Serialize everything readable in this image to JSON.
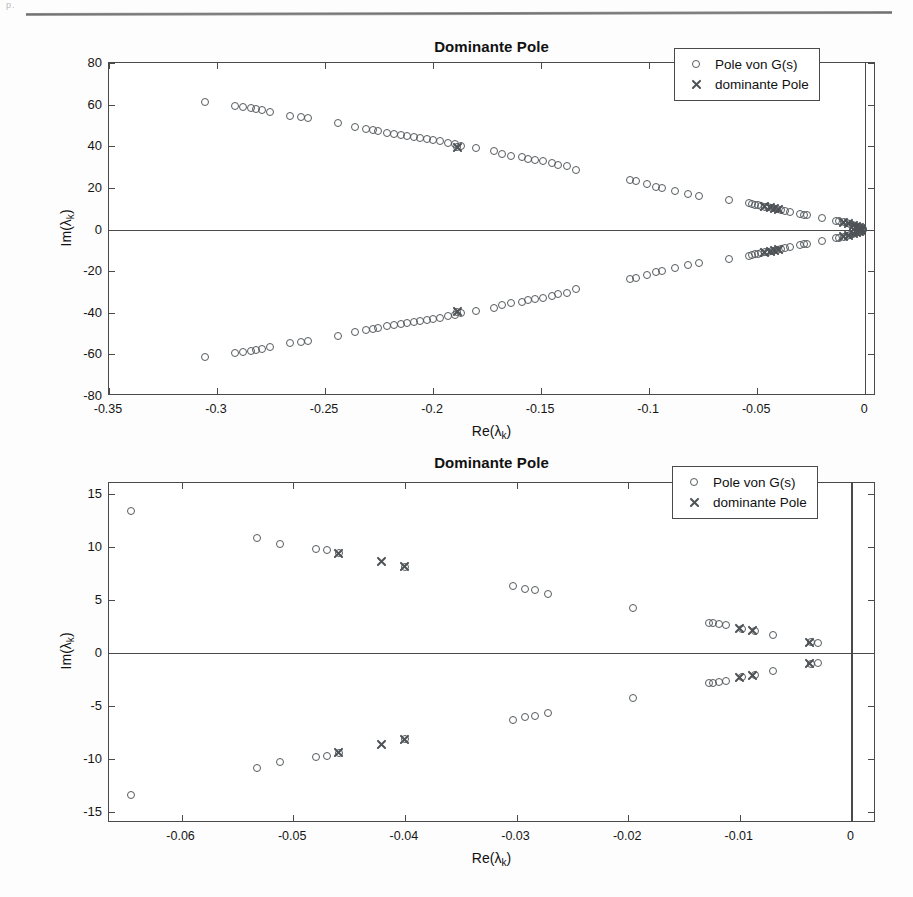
{
  "page": {
    "corner_mark": "p.",
    "background": "#fdfdfd",
    "rule_color": "#7a7a7a"
  },
  "colors": {
    "marker": "#555a5e",
    "axis": "#4a4a4a",
    "text": "#111111"
  },
  "legend": {
    "entries": [
      {
        "marker": "circle",
        "label": "Pole von G(s)"
      },
      {
        "marker": "cross",
        "label": "dominante Pole"
      }
    ]
  },
  "chart_data": [
    {
      "type": "scatter",
      "title": "Dominante Pole",
      "xlabel": "Re(λ_k)",
      "ylabel": "Im(λ_k)",
      "xlim": [
        -0.35,
        0.005
      ],
      "ylim": [
        -80,
        80
      ],
      "xticks": [
        -0.35,
        -0.3,
        -0.25,
        -0.2,
        -0.15,
        -0.1,
        -0.05,
        0
      ],
      "xticklabels": [
        "-0.35",
        "-0.3",
        "-0.25",
        "-0.2",
        "-0.15",
        "-0.1",
        "-0.05",
        "0"
      ],
      "yticks": [
        -80,
        -60,
        -40,
        -20,
        0,
        20,
        40,
        60,
        80
      ],
      "yticklabels": [
        "-80",
        "-60",
        "-40",
        "-20",
        "0",
        "20",
        "40",
        "60",
        "80"
      ],
      "grid": false,
      "legend_position": "upper right",
      "series": [
        {
          "name": "Pole von G(s)",
          "marker": "circle",
          "points": [
            [
              -0.3055,
              61.3
            ],
            [
              -0.2915,
              59.2
            ],
            [
              -0.288,
              58.9
            ],
            [
              -0.2845,
              58.4
            ],
            [
              -0.282,
              57.8
            ],
            [
              -0.279,
              57.3
            ],
            [
              -0.2755,
              56.6
            ],
            [
              -0.266,
              54.6
            ],
            [
              -0.261,
              54.0
            ],
            [
              -0.258,
              53.6
            ],
            [
              -0.244,
              51.0
            ],
            [
              -0.236,
              49.3
            ],
            [
              -0.231,
              48.1
            ],
            [
              -0.228,
              47.6
            ],
            [
              -0.2255,
              47.2
            ],
            [
              -0.2215,
              46.5
            ],
            [
              -0.218,
              45.9
            ],
            [
              -0.215,
              45.4
            ],
            [
              -0.212,
              44.9
            ],
            [
              -0.209,
              44.4
            ],
            [
              -0.206,
              43.9
            ],
            [
              -0.203,
              43.4
            ],
            [
              -0.2,
              42.9
            ],
            [
              -0.197,
              42.4
            ],
            [
              -0.193,
              41.6
            ],
            [
              -0.19,
              41.1
            ],
            [
              -0.187,
              40.3
            ],
            [
              -0.18,
              39.3
            ],
            [
              -0.189,
              39.7
            ],
            [
              -0.172,
              37.6
            ],
            [
              -0.168,
              36.3
            ],
            [
              -0.164,
              35.5
            ],
            [
              -0.159,
              34.6
            ],
            [
              -0.156,
              34.0
            ],
            [
              -0.153,
              33.6
            ],
            [
              -0.149,
              32.8
            ],
            [
              -0.145,
              32.0
            ],
            [
              -0.142,
              31.1
            ],
            [
              -0.138,
              30.3
            ],
            [
              -0.134,
              28.6
            ],
            [
              -0.109,
              23.8
            ],
            [
              -0.106,
              23.2
            ],
            [
              -0.101,
              21.8
            ],
            [
              -0.097,
              20.6
            ],
            [
              -0.094,
              19.7
            ],
            [
              -0.088,
              18.4
            ],
            [
              -0.082,
              16.9
            ],
            [
              -0.077,
              15.9
            ],
            [
              -0.063,
              14.4
            ],
            [
              -0.054,
              12.7
            ],
            [
              -0.0525,
              12.2
            ],
            [
              -0.051,
              11.9
            ],
            [
              -0.0495,
              11.6
            ],
            [
              -0.048,
              11.2
            ],
            [
              -0.0465,
              10.9
            ],
            [
              -0.045,
              10.6
            ],
            [
              -0.043,
              10.2
            ],
            [
              -0.041,
              9.8
            ],
            [
              -0.039,
              9.3
            ],
            [
              -0.037,
              8.9
            ],
            [
              -0.035,
              8.5
            ],
            [
              -0.03,
              7.4
            ],
            [
              -0.0285,
              7.1
            ],
            [
              -0.027,
              6.8
            ],
            [
              -0.02,
              5.6
            ],
            [
              -0.0135,
              4.2
            ],
            [
              -0.012,
              3.9
            ],
            [
              -0.01,
              3.4
            ],
            [
              -0.0085,
              3.0
            ],
            [
              -0.007,
              2.6
            ],
            [
              -0.0055,
              2.1
            ],
            [
              -0.0045,
              1.8
            ],
            [
              -0.0035,
              1.4
            ],
            [
              -0.0025,
              1.0
            ],
            [
              -0.0018,
              0.7
            ],
            [
              -0.001,
              0.4
            ],
            [
              -0.3055,
              -61.3
            ],
            [
              -0.2915,
              -59.2
            ],
            [
              -0.288,
              -58.9
            ],
            [
              -0.2845,
              -58.4
            ],
            [
              -0.282,
              -57.8
            ],
            [
              -0.279,
              -57.3
            ],
            [
              -0.2755,
              -56.6
            ],
            [
              -0.266,
              -54.6
            ],
            [
              -0.261,
              -54.0
            ],
            [
              -0.258,
              -53.6
            ],
            [
              -0.244,
              -51.0
            ],
            [
              -0.236,
              -49.3
            ],
            [
              -0.231,
              -48.1
            ],
            [
              -0.228,
              -47.6
            ],
            [
              -0.2255,
              -47.2
            ],
            [
              -0.2215,
              -46.5
            ],
            [
              -0.218,
              -45.9
            ],
            [
              -0.215,
              -45.4
            ],
            [
              -0.212,
              -44.9
            ],
            [
              -0.209,
              -44.4
            ],
            [
              -0.206,
              -43.9
            ],
            [
              -0.203,
              -43.4
            ],
            [
              -0.2,
              -42.9
            ],
            [
              -0.197,
              -42.4
            ],
            [
              -0.193,
              -41.6
            ],
            [
              -0.19,
              -41.1
            ],
            [
              -0.187,
              -40.3
            ],
            [
              -0.18,
              -39.3
            ],
            [
              -0.189,
              -39.7
            ],
            [
              -0.172,
              -37.6
            ],
            [
              -0.168,
              -36.3
            ],
            [
              -0.164,
              -35.5
            ],
            [
              -0.159,
              -34.6
            ],
            [
              -0.156,
              -34.0
            ],
            [
              -0.153,
              -33.6
            ],
            [
              -0.149,
              -32.8
            ],
            [
              -0.145,
              -32.0
            ],
            [
              -0.142,
              -31.1
            ],
            [
              -0.138,
              -30.3
            ],
            [
              -0.134,
              -28.6
            ],
            [
              -0.109,
              -23.8
            ],
            [
              -0.106,
              -23.2
            ],
            [
              -0.101,
              -21.8
            ],
            [
              -0.097,
              -20.6
            ],
            [
              -0.094,
              -19.7
            ],
            [
              -0.088,
              -18.4
            ],
            [
              -0.082,
              -16.9
            ],
            [
              -0.077,
              -15.9
            ],
            [
              -0.063,
              -14.4
            ],
            [
              -0.054,
              -12.7
            ],
            [
              -0.0525,
              -12.2
            ],
            [
              -0.051,
              -11.9
            ],
            [
              -0.0495,
              -11.6
            ],
            [
              -0.048,
              -11.2
            ],
            [
              -0.0465,
              -10.9
            ],
            [
              -0.045,
              -10.6
            ],
            [
              -0.043,
              -10.2
            ],
            [
              -0.041,
              -9.8
            ],
            [
              -0.039,
              -9.3
            ],
            [
              -0.037,
              -8.9
            ],
            [
              -0.035,
              -8.5
            ],
            [
              -0.03,
              -7.4
            ],
            [
              -0.0285,
              -7.1
            ],
            [
              -0.027,
              -6.8
            ],
            [
              -0.02,
              -5.6
            ],
            [
              -0.0135,
              -4.2
            ],
            [
              -0.012,
              -3.9
            ],
            [
              -0.01,
              -3.4
            ],
            [
              -0.0085,
              -3.0
            ],
            [
              -0.007,
              -2.6
            ],
            [
              -0.0055,
              -2.1
            ],
            [
              -0.0045,
              -1.8
            ],
            [
              -0.0035,
              -1.4
            ],
            [
              -0.0025,
              -1.0
            ],
            [
              -0.0018,
              -0.7
            ],
            [
              -0.001,
              -0.4
            ]
          ]
        },
        {
          "name": "dominante Pole",
          "marker": "cross",
          "points": [
            [
              -0.1885,
              39.6
            ],
            [
              -0.0465,
              10.9
            ],
            [
              -0.044,
              10.4
            ],
            [
              -0.042,
              10.0
            ],
            [
              -0.04,
              9.6
            ],
            [
              -0.01,
              3.4
            ],
            [
              -0.0075,
              2.7
            ],
            [
              -0.0055,
              2.1
            ],
            [
              -0.004,
              1.6
            ],
            [
              -0.0028,
              1.1
            ],
            [
              -0.0018,
              0.7
            ],
            [
              -0.1885,
              -39.6
            ],
            [
              -0.0465,
              -10.9
            ],
            [
              -0.044,
              -10.4
            ],
            [
              -0.042,
              -10.0
            ],
            [
              -0.04,
              -9.6
            ],
            [
              -0.01,
              -3.4
            ],
            [
              -0.0075,
              -2.7
            ],
            [
              -0.0055,
              -2.1
            ],
            [
              -0.004,
              -1.6
            ],
            [
              -0.0028,
              -1.1
            ],
            [
              -0.0018,
              -0.7
            ]
          ]
        }
      ]
    },
    {
      "type": "scatter",
      "title": "Dominante Pole",
      "xlabel": "Re(λ_k)",
      "ylabel": "Im(λ_k)",
      "xlim": [
        -0.0665,
        0.0022
      ],
      "ylim": [
        -16.0,
        16.0
      ],
      "xticks": [
        -0.06,
        -0.05,
        -0.04,
        -0.03,
        -0.02,
        -0.01,
        0
      ],
      "xticklabels": [
        "-0.06",
        "-0.05",
        "-0.04",
        "-0.03",
        "-0.02",
        "-0.01",
        "0"
      ],
      "yticks": [
        -15,
        -10,
        -5,
        0,
        5,
        10,
        15
      ],
      "yticklabels": [
        "-15",
        "-10",
        "-5",
        "0",
        "5",
        "10",
        "15"
      ],
      "grid": false,
      "legend_position": "upper right",
      "series": [
        {
          "name": "Pole von G(s)",
          "marker": "circle",
          "points": [
            [
              -0.0645,
              13.4
            ],
            [
              -0.0532,
              10.8
            ],
            [
              -0.0512,
              10.3
            ],
            [
              -0.048,
              9.8
            ],
            [
              -0.047,
              9.7
            ],
            [
              -0.0459,
              9.4
            ],
            [
              -0.04,
              8.1
            ],
            [
              -0.0303,
              6.3
            ],
            [
              -0.0292,
              6.0
            ],
            [
              -0.0283,
              5.9
            ],
            [
              -0.0272,
              5.6
            ],
            [
              -0.0196,
              4.2
            ],
            [
              -0.0128,
              2.8
            ],
            [
              -0.0124,
              2.8
            ],
            [
              -0.0119,
              2.7
            ],
            [
              -0.0112,
              2.6
            ],
            [
              -0.0098,
              2.3
            ],
            [
              -0.0086,
              2.1
            ],
            [
              -0.007,
              1.7
            ],
            [
              -0.0036,
              1.0
            ],
            [
              -0.003,
              0.9
            ],
            [
              -0.0645,
              -13.4
            ],
            [
              -0.0532,
              -10.8
            ],
            [
              -0.0512,
              -10.3
            ],
            [
              -0.048,
              -9.8
            ],
            [
              -0.047,
              -9.7
            ],
            [
              -0.0459,
              -9.4
            ],
            [
              -0.04,
              -8.1
            ],
            [
              -0.0303,
              -6.3
            ],
            [
              -0.0292,
              -6.0
            ],
            [
              -0.0283,
              -5.9
            ],
            [
              -0.0272,
              -5.6
            ],
            [
              -0.0196,
              -4.2
            ],
            [
              -0.0128,
              -2.8
            ],
            [
              -0.0124,
              -2.8
            ],
            [
              -0.0119,
              -2.7
            ],
            [
              -0.0112,
              -2.6
            ],
            [
              -0.0098,
              -2.3
            ],
            [
              -0.0086,
              -2.1
            ],
            [
              -0.007,
              -1.7
            ],
            [
              -0.0036,
              -1.0
            ],
            [
              -0.003,
              -0.9
            ]
          ]
        },
        {
          "name": "dominante Pole",
          "marker": "cross",
          "points": [
            [
              -0.0459,
              9.4
            ],
            [
              -0.0421,
              8.6
            ],
            [
              -0.04,
              8.1
            ],
            [
              -0.01,
              2.3
            ],
            [
              -0.0089,
              2.1
            ],
            [
              -0.0038,
              1.0
            ],
            [
              -0.0459,
              -9.4
            ],
            [
              -0.0421,
              -8.6
            ],
            [
              -0.04,
              -8.1
            ],
            [
              -0.01,
              -2.3
            ],
            [
              -0.0089,
              -2.1
            ],
            [
              -0.0038,
              -1.0
            ]
          ]
        }
      ]
    }
  ]
}
